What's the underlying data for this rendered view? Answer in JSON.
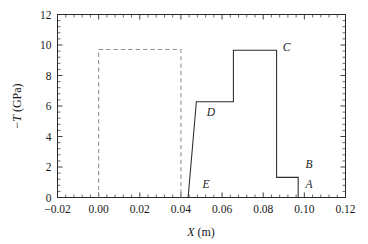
{
  "chart_data": {
    "type": "line",
    "title": "",
    "xlabel": "X (m)",
    "ylabel": "-T (GPa)",
    "xlim": [
      -0.02,
      0.12
    ],
    "ylim": [
      0,
      12
    ],
    "grid": false,
    "legend": "none",
    "xticks": [
      -0.02,
      0.0,
      0.02,
      0.04,
      0.06,
      0.08,
      0.1,
      0.12
    ],
    "xtick_labels": [
      "-0.02",
      "0.00",
      "0.02",
      "0.04",
      "0.06",
      "0.08",
      "0.10",
      "0.12"
    ],
    "yticks": [
      0,
      2,
      4,
      6,
      8,
      10,
      12
    ],
    "ytick_labels": [
      "0",
      "2",
      "4",
      "6",
      "8",
      "10",
      "12"
    ],
    "x_minor_tick_count": 4,
    "y_minor_tick_count": 4,
    "series": [
      {
        "name": "initial-profile",
        "style": "dashed",
        "color": "#8d8d8d",
        "x": [
          0.0,
          0.0,
          0.04,
          0.04
        ],
        "y": [
          0.0,
          9.7,
          9.7,
          0.0
        ]
      },
      {
        "name": "stress-profile",
        "style": "solid",
        "color": "#2b2b2b",
        "x": [
          0.0435,
          0.0475,
          0.0655,
          0.0655,
          0.0865,
          0.0865,
          0.097,
          0.097
        ],
        "y": [
          0.0,
          6.28,
          6.28,
          9.65,
          9.65,
          1.32,
          1.32,
          0.0
        ]
      }
    ],
    "annotations": [
      {
        "label": "A",
        "x": 0.1005,
        "y": 0.62
      },
      {
        "label": "B",
        "x": 0.1005,
        "y": 1.92
      },
      {
        "label": "C",
        "x": 0.0895,
        "y": 9.62
      },
      {
        "label": "D",
        "x": 0.0525,
        "y": 5.35
      },
      {
        "label": "E",
        "x": 0.0505,
        "y": 0.6
      }
    ]
  },
  "axis": {
    "y_label_prefix": "−",
    "y_label_symbol": "T",
    "y_label_unit": " (GPa)",
    "x_label_symbol": "X",
    "x_label_unit": " (m)"
  }
}
